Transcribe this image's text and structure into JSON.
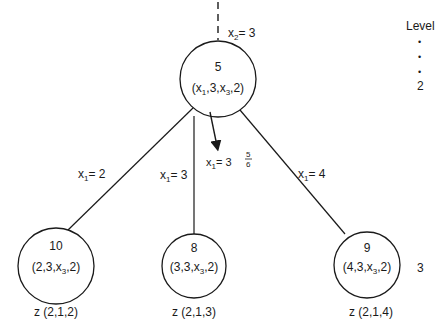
{
  "diagram": {
    "type": "branch-and-bound-tree",
    "incoming_branch": {
      "var": "x",
      "sub": "2",
      "eq": "= 3"
    },
    "level_label": {
      "title": "Level",
      "dots": [
        "•",
        "•",
        "•"
      ],
      "levels": [
        "2",
        "3"
      ]
    },
    "root": {
      "id": "5",
      "tuple": {
        "open": "(x",
        "s1": "1",
        "mid": ",3,x",
        "s3": "3",
        "close": ",2)"
      }
    },
    "arrow_label": {
      "var": "x",
      "sub": "1",
      "eq": "= 3",
      "frac_num": "5",
      "frac_den": "6"
    },
    "edges": [
      {
        "var": "x",
        "sub": "1",
        "eq": "= 2"
      },
      {
        "var": "x",
        "sub": "1",
        "eq": "= 3"
      },
      {
        "var": "x",
        "sub": "1",
        "eq": "= 4"
      }
    ],
    "children": [
      {
        "id": "10",
        "tuple_pre": "(2,3,x",
        "tuple_sub": "3",
        "tuple_post": ",2)",
        "z": "z (2,1,2)"
      },
      {
        "id": "8",
        "tuple_pre": "(3,3,x",
        "tuple_sub": "3",
        "tuple_post": ",2)",
        "z": "z (2,1,3)"
      },
      {
        "id": "9",
        "tuple_pre": "(4,3,x",
        "tuple_sub": "3",
        "tuple_post": ",2)",
        "z": "z (2,1,4)"
      }
    ]
  }
}
